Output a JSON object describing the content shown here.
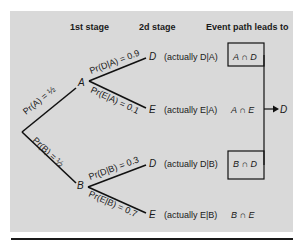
{
  "headers": {
    "stage1": "1st stage",
    "stage2": "2d stage",
    "event_path": "Event path leads to"
  },
  "nodes": {
    "A": "A",
    "B": "B",
    "AD": "D",
    "AE": "E",
    "BD": "D",
    "BE": "E"
  },
  "branches": {
    "root_A": "Pr(A) = ½",
    "root_B": "Pr(B) = ½",
    "A_D": "Pr(D|A) = 0.9",
    "A_E": "Pr(E|A) = 0.1",
    "B_D": "Pr(D|B) = 0.3",
    "B_E": "Pr(E|B) = 0.7"
  },
  "actually": {
    "AD": "(actually D|A)",
    "AE": "(actually E|A)",
    "BD": "(actually D|B)",
    "BE": "(actually E|B)"
  },
  "outcomes": {
    "AD": "A ∩ D",
    "AE": "A ∩ E",
    "BD": "B ∩ D",
    "BE": "B ∩ E"
  },
  "arrow_target": "D",
  "colors": {
    "panel": "#d9d9d9",
    "ink": "#1a1a1a"
  }
}
